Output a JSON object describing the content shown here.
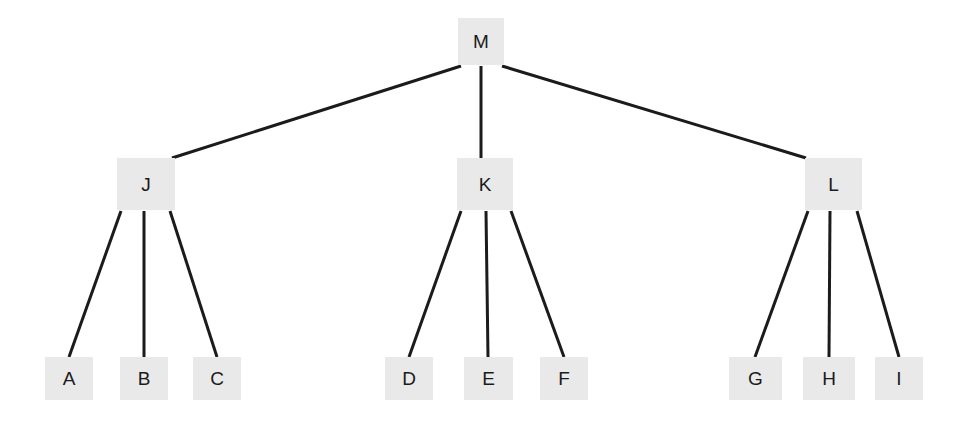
{
  "diagram": {
    "type": "tree",
    "width": 980,
    "height": 427,
    "background_color": "#ffffff",
    "node_fill_color": "#e9e9e9",
    "node_text_color": "#1b1b1b",
    "edge_color": "#1b1b1b",
    "edge_width": 3,
    "levels": 3,
    "root": "M",
    "nodes": [
      {
        "id": "root-m",
        "label": "M",
        "level": 0,
        "x": 458,
        "y": 18,
        "w": 46,
        "h": 47,
        "font_size": 19
      },
      {
        "id": "branch-j",
        "label": "J",
        "level": 1,
        "x": 117,
        "y": 158,
        "w": 58,
        "h": 52,
        "font_size": 19
      },
      {
        "id": "branch-k",
        "label": "K",
        "level": 1,
        "x": 457,
        "y": 158,
        "w": 56,
        "h": 52,
        "font_size": 19
      },
      {
        "id": "branch-l",
        "label": "L",
        "level": 1,
        "x": 805,
        "y": 158,
        "w": 57,
        "h": 52,
        "font_size": 19
      },
      {
        "id": "leaf-a",
        "label": "A",
        "level": 2,
        "x": 45,
        "y": 357,
        "w": 48,
        "h": 43,
        "font_size": 19
      },
      {
        "id": "leaf-b",
        "label": "B",
        "level": 2,
        "x": 120,
        "y": 357,
        "w": 48,
        "h": 43,
        "font_size": 19
      },
      {
        "id": "leaf-c",
        "label": "C",
        "level": 2,
        "x": 193,
        "y": 357,
        "w": 48,
        "h": 43,
        "font_size": 19
      },
      {
        "id": "leaf-d",
        "label": "D",
        "level": 2,
        "x": 385,
        "y": 357,
        "w": 48,
        "h": 43,
        "font_size": 19
      },
      {
        "id": "leaf-e",
        "label": "E",
        "level": 2,
        "x": 464,
        "y": 357,
        "w": 49,
        "h": 43,
        "font_size": 19
      },
      {
        "id": "leaf-f",
        "label": "F",
        "level": 2,
        "x": 540,
        "y": 357,
        "w": 48,
        "h": 43,
        "font_size": 19
      },
      {
        "id": "leaf-g",
        "label": "G",
        "level": 2,
        "x": 729,
        "y": 357,
        "w": 53,
        "h": 43,
        "font_size": 19
      },
      {
        "id": "leaf-h",
        "label": "H",
        "level": 2,
        "x": 803,
        "y": 357,
        "w": 52,
        "h": 43,
        "font_size": 19
      },
      {
        "id": "leaf-i",
        "label": "I",
        "level": 2,
        "x": 875,
        "y": 357,
        "w": 48,
        "h": 43,
        "font_size": 19
      }
    ],
    "edges": [
      {
        "id": "edge-m-j",
        "from": "M",
        "to": "J",
        "x1": 461,
        "y1": 66,
        "x2": 172,
        "y2": 158
      },
      {
        "id": "edge-m-k",
        "from": "M",
        "to": "K",
        "x1": 481,
        "y1": 66,
        "x2": 481,
        "y2": 158
      },
      {
        "id": "edge-m-l",
        "from": "M",
        "to": "L",
        "x1": 502,
        "y1": 66,
        "x2": 806,
        "y2": 158
      },
      {
        "id": "edge-j-a",
        "from": "J",
        "to": "A",
        "x1": 121,
        "y1": 211,
        "x2": 69,
        "y2": 357
      },
      {
        "id": "edge-j-b",
        "from": "J",
        "to": "B",
        "x1": 144,
        "y1": 211,
        "x2": 144,
        "y2": 357
      },
      {
        "id": "edge-j-c",
        "from": "J",
        "to": "C",
        "x1": 170,
        "y1": 211,
        "x2": 217,
        "y2": 357
      },
      {
        "id": "edge-k-d",
        "from": "K",
        "to": "D",
        "x1": 461,
        "y1": 211,
        "x2": 409,
        "y2": 357
      },
      {
        "id": "edge-k-e",
        "from": "K",
        "to": "E",
        "x1": 486,
        "y1": 211,
        "x2": 488,
        "y2": 357
      },
      {
        "id": "edge-k-f",
        "from": "K",
        "to": "F",
        "x1": 511,
        "y1": 211,
        "x2": 564,
        "y2": 357
      },
      {
        "id": "edge-l-g",
        "from": "L",
        "to": "G",
        "x1": 808,
        "y1": 211,
        "x2": 755,
        "y2": 357
      },
      {
        "id": "edge-l-h",
        "from": "L",
        "to": "H",
        "x1": 830,
        "y1": 211,
        "x2": 829,
        "y2": 357
      },
      {
        "id": "edge-l-i",
        "from": "L",
        "to": "I",
        "x1": 857,
        "y1": 211,
        "x2": 899,
        "y2": 357
      }
    ]
  }
}
